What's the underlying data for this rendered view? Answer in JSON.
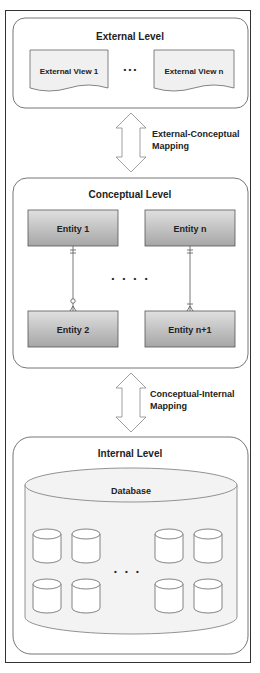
{
  "external_level": {
    "title": "External Level",
    "views": [
      "External View 1",
      "External View n"
    ],
    "ellipsis": "• • •"
  },
  "mapping_1": {
    "line1": "External-Conceptual",
    "line2": "Mapping"
  },
  "conceptual_level": {
    "title": "Conceptual Level",
    "entities": [
      "Entity 1",
      "Entity n",
      "Entity 2",
      "Entity n+1"
    ],
    "ellipsis": "• • • •"
  },
  "mapping_2": {
    "line1": "Conceptual-Internal",
    "line2": "Mapping"
  },
  "internal_level": {
    "title": "Internal Level",
    "database_label": "Database",
    "ellipsis": "• • •"
  },
  "colors": {
    "stroke": "#555555",
    "entity_fill_top": "#dcdcdc",
    "entity_fill_bottom": "#a8a8a8",
    "panel_fill": "#f4f4f4"
  }
}
